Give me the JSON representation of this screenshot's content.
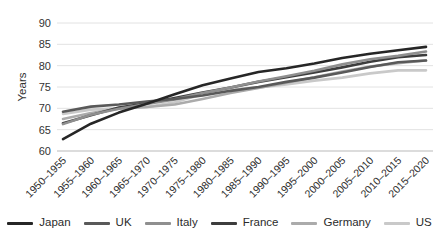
{
  "chart_data": {
    "type": "line",
    "title": "",
    "xlabel": "",
    "ylabel": "Years",
    "ylim": [
      60,
      90
    ],
    "yticks": [
      60,
      65,
      70,
      75,
      80,
      85,
      90
    ],
    "grid": true,
    "legend_position": "bottom",
    "categories": [
      "1950–1955",
      "1955–1960",
      "1960–1965",
      "1965–1970",
      "1970–1975",
      "1975–1980",
      "1980–1985",
      "1985–1990",
      "1990–1995",
      "1995–2000",
      "2000–2005",
      "2005–2010",
      "2010–2015",
      "2015–2020"
    ],
    "series": [
      {
        "name": "Japan",
        "color": "#262626",
        "values": [
          62.8,
          66.4,
          69.0,
          71.1,
          73.3,
          75.4,
          77.0,
          78.5,
          79.4,
          80.5,
          81.8,
          82.8,
          83.6,
          84.4
        ]
      },
      {
        "name": "UK",
        "color": "#595959",
        "values": [
          69.2,
          70.4,
          70.9,
          71.6,
          72.2,
          73.0,
          74.1,
          75.0,
          76.2,
          77.2,
          78.4,
          79.7,
          80.8,
          81.2
        ]
      },
      {
        "name": "Italy",
        "color": "#8f8f8f",
        "values": [
          66.3,
          68.5,
          69.9,
          71.0,
          72.1,
          73.6,
          74.9,
          76.3,
          77.5,
          78.8,
          80.3,
          81.5,
          82.3,
          83.3
        ]
      },
      {
        "name": "France",
        "color": "#3d3d3d",
        "values": [
          66.5,
          68.4,
          70.2,
          71.2,
          72.4,
          73.7,
          74.9,
          76.2,
          77.3,
          78.4,
          79.6,
          80.9,
          82.0,
          82.5
        ]
      },
      {
        "name": "Germany",
        "color": "#ababab",
        "values": [
          67.5,
          68.9,
          69.9,
          70.3,
          70.9,
          72.2,
          73.6,
          74.8,
          76.0,
          77.3,
          78.6,
          79.8,
          80.6,
          81.2
        ]
      },
      {
        "name": "US",
        "color": "#c9c9c9",
        "values": [
          68.7,
          69.7,
          70.0,
          70.3,
          71.4,
          73.3,
          74.4,
          74.9,
          75.6,
          76.5,
          77.2,
          78.2,
          78.9,
          78.9
        ]
      }
    ],
    "grid_color": "#e2e2e2",
    "axis_line_color": "#b9b9b9"
  }
}
